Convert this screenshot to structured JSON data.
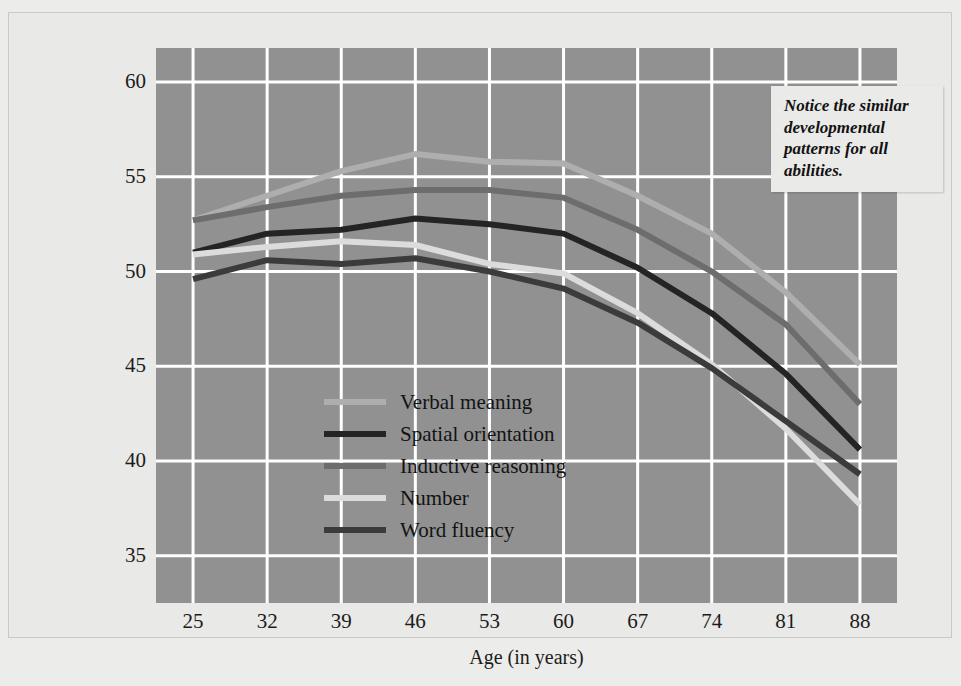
{
  "figure": {
    "background_color": "#ececeb",
    "plot_background_color": "#919191",
    "grid_color": "#ffffff"
  },
  "annotation": {
    "text": "Notice the similar developmental patterns for all abilities."
  },
  "caption": {
    "text": ""
  },
  "legend": {
    "position": "inside-lower-left",
    "items": [
      {
        "label": "Verbal meaning",
        "color": "#aeaeae"
      },
      {
        "label": "Spatial orientation",
        "color": "#242424"
      },
      {
        "label": "Inductive reasoning",
        "color": "#6d6d6d"
      },
      {
        "label": "Number",
        "color": "#dcdcdc"
      },
      {
        "label": "Word fluency",
        "color": "#3b3b3b"
      }
    ]
  },
  "chart_data": {
    "type": "line",
    "title": "",
    "xlabel": "Age (in years)",
    "ylabel": "Average standardized score",
    "x": [
      25,
      32,
      39,
      46,
      53,
      60,
      67,
      74,
      81,
      88
    ],
    "xtick_labels": [
      "25",
      "32",
      "39",
      "46",
      "53",
      "60",
      "67",
      "74",
      "81",
      "88"
    ],
    "ytick_labels": [
      "35",
      "40",
      "45",
      "50",
      "55",
      "60"
    ],
    "yticks": [
      35,
      40,
      45,
      50,
      55,
      60
    ],
    "xlim": [
      21.5,
      91.5
    ],
    "ylim": [
      32.5,
      61.8
    ],
    "grid": true,
    "legend_position": "inside-lower-left",
    "series": [
      {
        "name": "Verbal meaning",
        "color": "#aeaeae",
        "values": [
          52.7,
          54.0,
          55.3,
          56.2,
          55.8,
          55.7,
          54.0,
          52.0,
          48.9,
          45.1
        ]
      },
      {
        "name": "Spatial orientation",
        "color": "#242424",
        "values": [
          51.0,
          52.0,
          52.2,
          52.8,
          52.5,
          52.0,
          50.2,
          47.8,
          44.6,
          40.6
        ]
      },
      {
        "name": "Inductive reasoning",
        "color": "#6d6d6d",
        "values": [
          52.7,
          53.4,
          54.0,
          54.3,
          54.3,
          53.9,
          52.2,
          50.0,
          47.2,
          43.0
        ]
      },
      {
        "name": "Number",
        "color": "#dcdcdc",
        "values": [
          50.9,
          51.3,
          51.6,
          51.4,
          50.4,
          49.9,
          47.8,
          45.1,
          41.7,
          37.7
        ]
      },
      {
        "name": "Word fluency",
        "color": "#3b3b3b",
        "values": [
          49.6,
          50.6,
          50.4,
          50.7,
          50.0,
          49.1,
          47.3,
          44.9,
          42.1,
          39.3
        ]
      }
    ]
  }
}
